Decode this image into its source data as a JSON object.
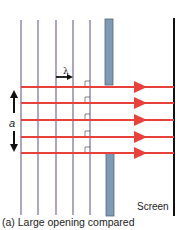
{
  "diagram": {
    "labels": {
      "wavelength": "λ",
      "aperture": "a",
      "screen": "Screen",
      "caption": "(a) Large opening compared"
    },
    "wavefronts_x": [
      21,
      38,
      56,
      73,
      90
    ],
    "rays_y": [
      87,
      103,
      120,
      137,
      153
    ],
    "colors": {
      "wavefront": "#7a6a9a",
      "ray": "#e8403a",
      "barrier": "#7e9bb5",
      "screen": "#111111"
    }
  }
}
